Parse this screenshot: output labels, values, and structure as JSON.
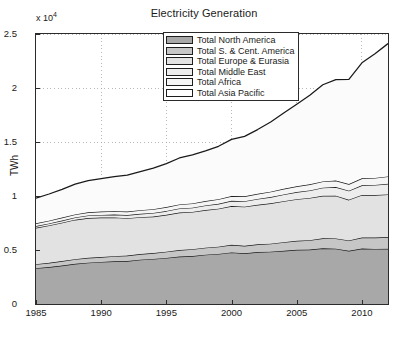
{
  "chart_data": {
    "type": "area",
    "stacked": true,
    "title": "Electricity Generation",
    "xlabel": "",
    "ylabel": "TWh",
    "y_exponent_label": "x 10",
    "y_exponent_power": "4",
    "y_multiplier": 10000,
    "xlim": [
      1985,
      2012
    ],
    "ylim": [
      0,
      25000
    ],
    "xticks": [
      1985,
      1990,
      1995,
      2000,
      2005,
      2010
    ],
    "xticklabels": [
      "1985",
      "1990",
      "1995",
      "2000",
      "2005",
      "2010"
    ],
    "yticks": [
      0,
      5000,
      10000,
      15000,
      20000,
      25000
    ],
    "yticklabels": [
      "0",
      "0.5",
      "1",
      "1.5",
      "2",
      "2.5"
    ],
    "grid": true,
    "grid_style": "dotted",
    "legend_position": "north-center",
    "x": [
      1985,
      1986,
      1987,
      1988,
      1989,
      1990,
      1991,
      1992,
      1993,
      1994,
      1995,
      1996,
      1997,
      1998,
      1999,
      2000,
      2001,
      2002,
      2003,
      2004,
      2005,
      2006,
      2007,
      2008,
      2009,
      2010,
      2011,
      2012
    ],
    "series": [
      {
        "name": "Total North America",
        "color": "#a8a8a8",
        "values": [
          3320,
          3420,
          3560,
          3720,
          3830,
          3890,
          3950,
          3980,
          4100,
          4170,
          4270,
          4390,
          4440,
          4560,
          4640,
          4780,
          4690,
          4810,
          4840,
          4930,
          5020,
          5040,
          5160,
          5120,
          4930,
          5130,
          5100,
          5110
        ]
      },
      {
        "name": "Total S. & Cent. America",
        "color": "#c6c6c6",
        "values": [
          370,
          390,
          410,
          430,
          450,
          460,
          480,
          500,
          520,
          550,
          570,
          600,
          630,
          650,
          670,
          700,
          700,
          720,
          750,
          790,
          830,
          870,
          920,
          950,
          950,
          1020,
          1050,
          1090
        ]
      },
      {
        "name": "Total Europe & Eurasia",
        "color": "#e2e2e2",
        "values": [
          3360,
          3460,
          3560,
          3650,
          3680,
          3650,
          3580,
          3460,
          3420,
          3380,
          3420,
          3480,
          3450,
          3490,
          3520,
          3590,
          3620,
          3650,
          3730,
          3800,
          3850,
          3910,
          3940,
          3960,
          3770,
          3950,
          3940,
          3950
        ]
      },
      {
        "name": "Total Middle East",
        "color": "#ededed",
        "values": [
          170,
          185,
          200,
          215,
          235,
          250,
          270,
          290,
          310,
          330,
          350,
          375,
          400,
          425,
          450,
          480,
          510,
          545,
          580,
          620,
          660,
          700,
          750,
          800,
          840,
          890,
          930,
          980
        ]
      },
      {
        "name": "Total Africa",
        "color": "#f5f5f5",
        "values": [
          250,
          260,
          270,
          280,
          290,
          305,
          315,
          325,
          335,
          345,
          360,
          375,
          390,
          405,
          420,
          440,
          455,
          475,
          495,
          520,
          540,
          560,
          580,
          600,
          610,
          645,
          650,
          680
        ]
      },
      {
        "name": "Total Asia Pacific",
        "color": "#fbfbfb",
        "values": [
          2330,
          2470,
          2620,
          2800,
          2930,
          3050,
          3200,
          3380,
          3580,
          3800,
          4030,
          4300,
          4500,
          4650,
          4900,
          5250,
          5550,
          5950,
          6450,
          7030,
          7600,
          8250,
          8950,
          9350,
          9700,
          10700,
          11500,
          12300
        ]
      }
    ],
    "totals": [
      9800,
      10185,
      10620,
      11095,
      11415,
      11605,
      11795,
      11935,
      12265,
      12575,
      13000,
      13520,
      13810,
      14180,
      14600,
      15240,
      15525,
      16150,
      16845,
      17690,
      18500,
      19330,
      20300,
      20780,
      20800,
      22335,
      23170,
      24110
    ],
    "annotations": []
  },
  "legend": {
    "items": [
      {
        "label": "Total North America",
        "swatch": "#a8a8a8"
      },
      {
        "label": "Total S. & Cent. America",
        "swatch": "#c6c6c6"
      },
      {
        "label": "Total Europe & Eurasia",
        "swatch": "#e2e2e2"
      },
      {
        "label": "Total Middle East",
        "swatch": "#ededed"
      },
      {
        "label": "Total Africa",
        "swatch": "#f5f5f5"
      },
      {
        "label": "Total Asia Pacific",
        "swatch": "#ffffff"
      }
    ]
  },
  "style": {
    "axis_color": "#2b2b2b",
    "grid_color": "#9a9a9a",
    "line_color": "#1a1a1a",
    "background": "#ffffff"
  }
}
